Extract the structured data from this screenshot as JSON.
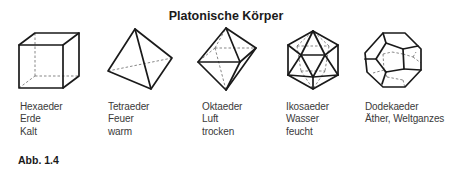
{
  "figure": {
    "title": "Platonische Körper",
    "label": "Abb. 1.4",
    "solids": [
      {
        "name": "Hexaeder",
        "element": "Erde",
        "quality": "Kalt",
        "icon": "cube-icon"
      },
      {
        "name": "Tetraeder",
        "element": "Feuer",
        "quality": "warm",
        "icon": "tetrahedron-icon"
      },
      {
        "name": "Oktaeder",
        "element": "Luft",
        "quality": "trocken",
        "icon": "octahedron-icon"
      },
      {
        "name": "Ikosaeder",
        "element": "Wasser",
        "quality": "feucht",
        "icon": "icosahedron-icon"
      },
      {
        "name": "Dodekaeder",
        "element": "Äther, Weltganzes",
        "quality": "",
        "icon": "dodecahedron-icon"
      }
    ]
  }
}
